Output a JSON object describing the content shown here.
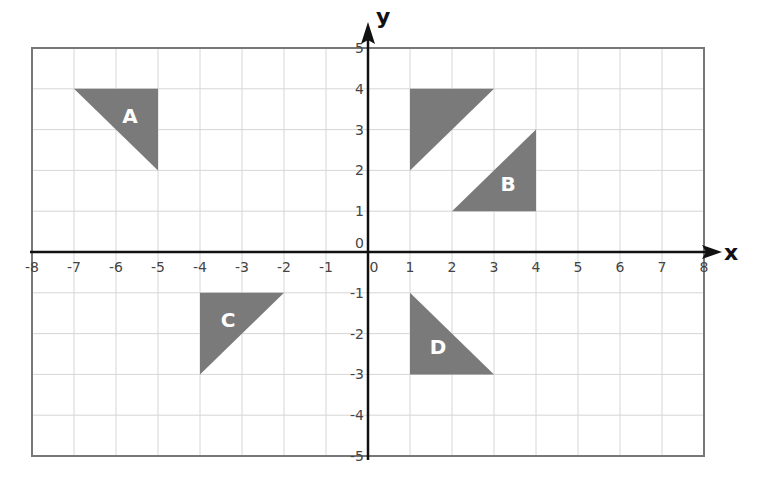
{
  "diagram": {
    "type": "coordinate-grid",
    "x_axis_label": "x",
    "y_axis_label": "y",
    "x_range": [
      -8,
      8
    ],
    "y_range": [
      -5,
      5
    ],
    "x_ticks": [
      "-8",
      "-7",
      "-6",
      "-5",
      "-4",
      "-3",
      "-2",
      "-1",
      "0",
      "1",
      "2",
      "3",
      "4",
      "5",
      "6",
      "7",
      "8"
    ],
    "y_ticks": [
      "5",
      "4",
      "3",
      "2",
      "1",
      "0",
      "-1",
      "-2",
      "-3",
      "-4",
      "-5"
    ],
    "colors": {
      "shape_fill": "#7a7a7a",
      "grid": "#d6d6d6",
      "border": "#777777",
      "axis": "#111111",
      "label_text": "#ffffff"
    },
    "shapes": [
      {
        "name": "A",
        "label": "A",
        "vertices": [
          [
            -7,
            4
          ],
          [
            -5,
            4
          ],
          [
            -5,
            2
          ]
        ]
      },
      {
        "name": "unlabeled",
        "label": "",
        "vertices": [
          [
            1,
            4
          ],
          [
            3,
            4
          ],
          [
            1,
            2
          ]
        ]
      },
      {
        "name": "B",
        "label": "B",
        "vertices": [
          [
            4,
            3
          ],
          [
            4,
            1
          ],
          [
            2,
            1
          ]
        ]
      },
      {
        "name": "C",
        "label": "C",
        "vertices": [
          [
            -4,
            -1
          ],
          [
            -2,
            -1
          ],
          [
            -4,
            -3
          ]
        ]
      },
      {
        "name": "D",
        "label": "D",
        "vertices": [
          [
            1,
            -1
          ],
          [
            1,
            -3
          ],
          [
            3,
            -3
          ]
        ]
      }
    ]
  }
}
